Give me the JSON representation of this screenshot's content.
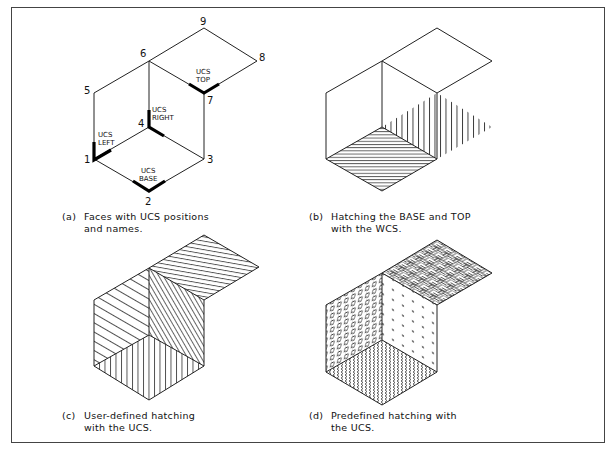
{
  "figure": {
    "panels": [
      {
        "id": "a",
        "caption_tag": "(a)",
        "caption_line1": "Faces with UCS positions",
        "caption_line2": "and names.",
        "vertex_labels": [
          "1",
          "2",
          "3",
          "4",
          "5",
          "6",
          "7",
          "8",
          "9"
        ],
        "ucs_labels": {
          "left": [
            "UCS",
            "LEFT"
          ],
          "right": [
            "UCS",
            "RIGHT"
          ],
          "base": [
            "UCS",
            "BASE"
          ],
          "top": [
            "UCS",
            "TOP"
          ]
        }
      },
      {
        "id": "b",
        "caption_tag": "(b)",
        "caption_line1": "Hatching the BASE and TOP",
        "caption_line2": "with the WCS."
      },
      {
        "id": "c",
        "caption_tag": "(c)",
        "caption_line1": "User-defined hatching",
        "caption_line2": "with the UCS."
      },
      {
        "id": "d",
        "caption_tag": "(d)",
        "caption_line1": "Predefined hatching with",
        "caption_line2": "the UCS."
      }
    ],
    "colors": {
      "line": "#222222",
      "background": "#ffffff",
      "border": "#444444"
    }
  }
}
